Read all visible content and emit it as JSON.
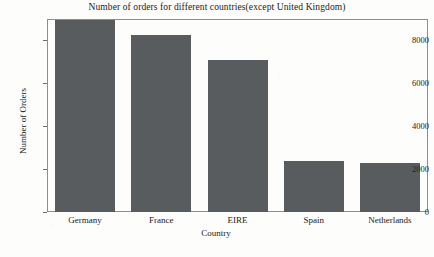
{
  "chart_data": {
    "type": "bar",
    "title": "Number of orders for different countries(except United Kingdom)",
    "xlabel": "Country",
    "ylabel": "Number of Orders",
    "categories": [
      "Germany",
      "France",
      "EIRE",
      "Spain",
      "Netherlands"
    ],
    "values": [
      8950,
      8250,
      7100,
      2400,
      2300
    ],
    "yticks": [
      0,
      2000,
      4000,
      6000,
      8000
    ],
    "ytick_labels": [
      "0",
      "2000",
      "4000",
      "6000",
      "8000"
    ],
    "ylim": [
      0,
      9000
    ],
    "grid": false,
    "legend": "none",
    "bar_color": "#585c5e",
    "frame_color": "#8e8e8e",
    "background_color": "#fdfdfc"
  }
}
